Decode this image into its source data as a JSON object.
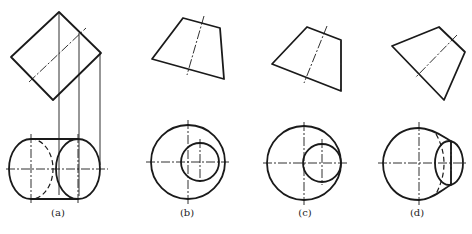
{
  "figures": [
    {
      "id": "a",
      "label": "(a)",
      "label_x": 58,
      "label_y": 207
    },
    {
      "id": "b",
      "label": "(b)",
      "label_x": 185,
      "label_y": 207
    },
    {
      "id": "c",
      "label": "(c)",
      "label_x": 308,
      "label_y": 207
    },
    {
      "id": "d",
      "label": "(d)",
      "label_x": 417,
      "label_y": 207
    }
  ],
  "colors": {
    "line": "#1a1a1a",
    "background": "#ffffff"
  }
}
